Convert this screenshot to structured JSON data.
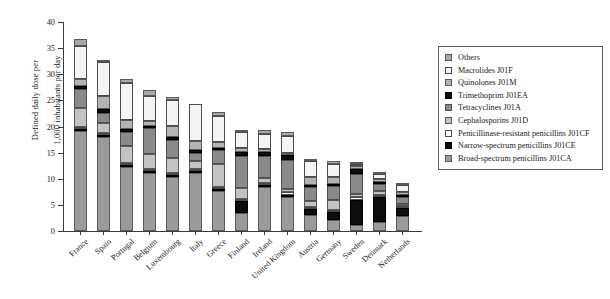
{
  "chart_data": {
    "type": "bar",
    "stacked": true,
    "title": "",
    "xlabel": "",
    "ylabel": "Defined daily dose per\n1,000 inhabitants per day",
    "ylim": [
      0,
      40
    ],
    "yticks": [
      0,
      5,
      10,
      15,
      20,
      25,
      30,
      35,
      40
    ],
    "grid": false,
    "legend_position": "right",
    "categories": [
      "France",
      "Spain",
      "Portugal",
      "Belgium",
      "Luxembourg",
      "Italy",
      "Greece",
      "Finland",
      "Ireland",
      "United Kingdom",
      "Austria",
      "Germany",
      "Sweden",
      "Denmark",
      "Netherlands"
    ],
    "series": [
      {
        "name": "Broad-spectrum penicillins J01CA",
        "key": "broad",
        "color": "#9b9b9b",
        "values": [
          19.1,
          18.0,
          12.2,
          11.1,
          10.4,
          11.1,
          7.6,
          3.5,
          8.4,
          6.6,
          3.1,
          2.2,
          1.1,
          1.8,
          2.9
        ]
      },
      {
        "name": "Narrow-spectrum penicillins J01CE",
        "key": "narrow",
        "color": "#0d0d0d",
        "values": [
          0.4,
          0.3,
          0.3,
          0.3,
          0.3,
          0.2,
          0.2,
          2.2,
          0.3,
          0.2,
          1.2,
          1.4,
          4.8,
          4.8,
          1.5
        ]
      },
      {
        "name": "Penicillinase-resistant penicillins J01CF",
        "key": "pen",
        "color": "#ffffff",
        "values": [
          0.5,
          0.2,
          0.2,
          0.2,
          0.2,
          0.2,
          0.2,
          0.2,
          0.2,
          0.5,
          0.2,
          0.5,
          0.7,
          0.2,
          0.3
        ]
      },
      {
        "name": "Cephalosporins J01D",
        "key": "ceph",
        "color": "#c3c3c3",
        "values": [
          3.5,
          2.0,
          3.3,
          2.9,
          2.9,
          1.6,
          4.4,
          2.2,
          0.9,
          0.6,
          1.1,
          1.8,
          0.4,
          0.6,
          0.2
        ]
      },
      {
        "name": "Tetracyclines J01A",
        "key": "tetra",
        "color": "#8a8a8a",
        "values": [
          3.6,
          1.9,
          2.7,
          4.9,
          3.4,
          1.4,
          2.8,
          6.0,
          4.3,
          5.5,
          2.7,
          2.7,
          4.0,
          1.4,
          1.3
        ]
      },
      {
        "name": "Trimethoprim J01EA",
        "key": "trim",
        "color": "#0d0d0d",
        "values": [
          0.6,
          0.6,
          0.5,
          0.4,
          0.6,
          0.6,
          0.4,
          0.8,
          0.7,
          0.9,
          0.4,
          0.5,
          0.9,
          0.4,
          0.4
        ]
      },
      {
        "name": "Quinolones J01M",
        "key": "quin",
        "color": "#b4b4b4",
        "values": [
          1.4,
          2.6,
          1.8,
          1.0,
          2.1,
          1.7,
          1.1,
          0.9,
          0.7,
          0.4,
          1.4,
          1.2,
          0.6,
          0.5,
          0.6
        ]
      },
      {
        "name": "Macrolides J01F",
        "key": "macro",
        "color": "#f4f4f4",
        "values": [
          6.4,
          6.5,
          7.0,
          4.7,
          5.0,
          7.1,
          5.0,
          3.0,
          2.9,
          3.3,
          3.2,
          2.5,
          0.4,
          1.1,
          1.3
        ]
      },
      {
        "name": "Others",
        "key": "others",
        "color": "#a8a8a8",
        "values": [
          1.2,
          0.3,
          0.8,
          1.2,
          0.5,
          0.0,
          0.8,
          0.4,
          0.7,
          0.8,
          0.4,
          0.6,
          0.4,
          0.4,
          0.2
        ]
      }
    ],
    "totals": [
      36.7,
      32.4,
      28.8,
      26.7,
      25.4,
      23.9,
      22.5,
      19.2,
      19.1,
      18.8,
      13.7,
      13.4,
      13.3,
      11.2,
      8.7
    ]
  },
  "legend": {
    "items": [
      {
        "label": "Others",
        "key": "others"
      },
      {
        "label": "Macrolides J01F",
        "key": "macro"
      },
      {
        "label": "Quinolones J01M",
        "key": "quin"
      },
      {
        "label": "Trimethoprim J01EA",
        "key": "trim"
      },
      {
        "label": "Tetracyclines J01A",
        "key": "tetra"
      },
      {
        "label": "Cephalosporins J01D",
        "key": "ceph"
      },
      {
        "label": "Penicillinase-resistant penicillins J01CF",
        "key": "pen"
      },
      {
        "label": "Narrow-spectrum penicillins J01CE",
        "key": "narrow"
      },
      {
        "label": "Broad-spectrum penicillins J01CA",
        "key": "broad"
      }
    ]
  },
  "axis": {
    "y_title_line1": "Defined daily dose per",
    "y_title_line2": "1,000 inhabitants per day"
  }
}
